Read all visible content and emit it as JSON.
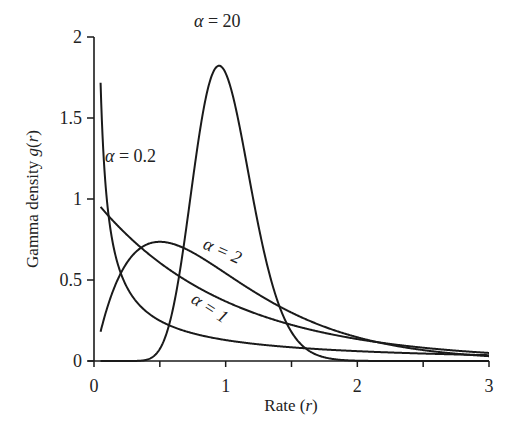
{
  "chart_data": {
    "type": "line",
    "title": "",
    "xlabel": "Rate (r)",
    "ylabel": "Gamma density g(r)",
    "xlim": [
      0,
      3
    ],
    "ylim": [
      0,
      2
    ],
    "x_ticks": [
      0,
      0.5,
      1,
      1.5,
      2,
      2.5,
      3
    ],
    "x_tick_labels": [
      "0",
      "",
      "1",
      "",
      "2",
      "",
      "3"
    ],
    "y_ticks": [
      0,
      0.5,
      1,
      1.5,
      2
    ],
    "y_tick_labels": [
      "0",
      "0.5",
      "1",
      "1.5",
      "2"
    ],
    "grid": false,
    "legend": "none (inline curve labels)",
    "formula": "g(r) = α^α r^(α−1) e^(−αr) / Γ(α)  (gamma with mean 1)",
    "x_start": 0.05,
    "series": [
      {
        "name": "α = 0.2",
        "alpha": 0.2,
        "x": [
          0.05,
          0.1,
          0.2,
          0.5,
          1,
          1.5,
          2,
          2.5,
          3
        ],
        "values": [
          1.71,
          1.0,
          0.55,
          0.23,
          0.1,
          0.056,
          0.034,
          0.022,
          0.014
        ]
      },
      {
        "name": "α = 1",
        "alpha": 1,
        "x": [
          0.05,
          0.1,
          0.2,
          0.5,
          1,
          1.5,
          2,
          2.5,
          3
        ],
        "values": [
          0.95,
          0.9,
          0.82,
          0.61,
          0.37,
          0.22,
          0.14,
          0.08,
          0.05
        ]
      },
      {
        "name": "α = 2",
        "alpha": 2,
        "x": [
          0.05,
          0.1,
          0.2,
          0.5,
          1,
          1.5,
          2,
          2.5,
          3
        ],
        "values": [
          0.18,
          0.33,
          0.54,
          0.74,
          0.54,
          0.3,
          0.15,
          0.07,
          0.03
        ]
      },
      {
        "name": "α = 20",
        "alpha": 20,
        "x": [
          0.4,
          0.6,
          0.8,
          0.95,
          1.0,
          1.2,
          1.4,
          1.6,
          1.8
        ],
        "values": [
          0.002,
          0.12,
          1.07,
          1.82,
          1.78,
          0.8,
          0.17,
          0.02,
          0.001
        ]
      }
    ],
    "annotations": [
      {
        "text": "α = 20",
        "x": 1.0,
        "y": 1.93
      },
      {
        "text": "α = 0.2",
        "x": 0.22,
        "y": 1.23
      },
      {
        "text": "α = 2",
        "x": 1.15,
        "y": 0.66,
        "rotation": 25
      },
      {
        "text": "α = 1",
        "x": 0.98,
        "y": 0.42,
        "rotation": 32
      }
    ]
  },
  "labels": {
    "x_axis_prefix": "Rate (",
    "x_axis_var": "r",
    "x_axis_suffix": ")",
    "y_axis_prefix": "Gamma density ",
    "y_axis_fn": "g",
    "y_axis_open": "(",
    "y_axis_var": "r",
    "y_axis_close": ")",
    "alpha_symbol": "α",
    "curve_20": " = 20",
    "curve_02": " = 0.2",
    "curve_2": " = 2",
    "curve_1": " = 1"
  },
  "style": {
    "line_color": "#1a1a1a",
    "background": "#ffffff"
  }
}
